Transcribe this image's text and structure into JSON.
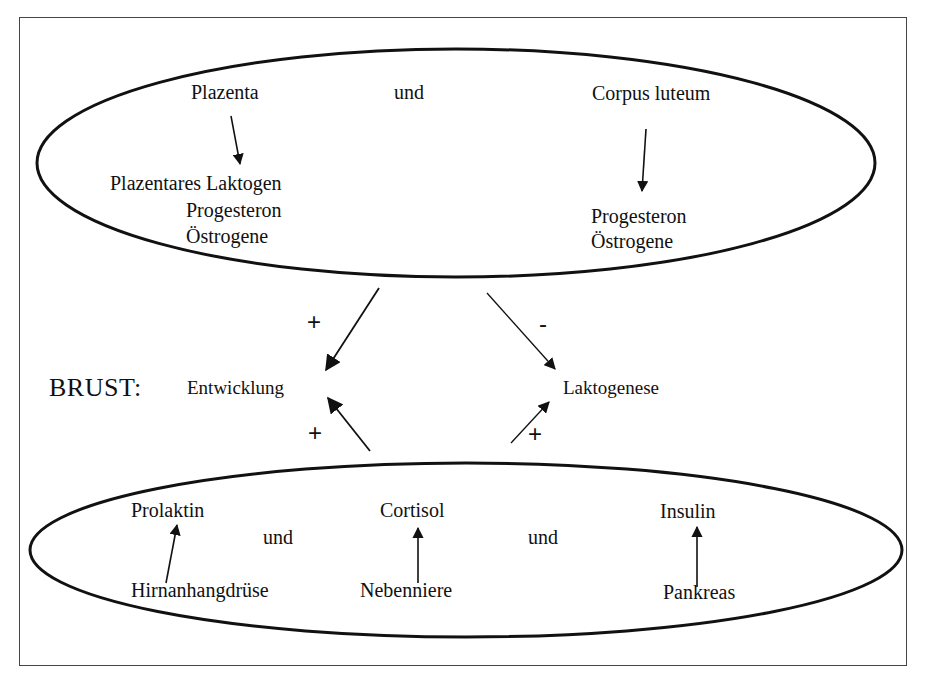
{
  "diagram": {
    "top_group": {
      "source_left": "Plazenta",
      "connector": "und",
      "source_right": "Corpus luteum",
      "products_left": [
        "Plazentares Laktogen",
        "Progesteron",
        "Östrogene"
      ],
      "products_right": [
        "Progesteron",
        "Östrogene"
      ]
    },
    "middle": {
      "organ_label": "BRUST:",
      "process_left": "Entwicklung",
      "process_right": "Laktogenese",
      "signs": {
        "top_to_entwicklung": "+",
        "top_to_laktogenese": "-",
        "bottom_to_entwicklung": "+",
        "bottom_to_laktogenese": "+"
      }
    },
    "bottom_group": {
      "hormones": [
        "Prolaktin",
        "Cortisol",
        "Insulin"
      ],
      "sources": [
        "Hirnanhangdrüse",
        "Nebenniere",
        "Pankreas"
      ],
      "connectors": [
        "und",
        "und"
      ]
    },
    "edges": [
      {
        "from": "Plazenta",
        "to": "Plazentares Laktogen / Progesteron / Östrogene"
      },
      {
        "from": "Corpus luteum",
        "to": "Progesteron / Östrogene"
      },
      {
        "from": "Top group",
        "to": "Entwicklung",
        "sign": "+"
      },
      {
        "from": "Top group",
        "to": "Laktogenese",
        "sign": "-"
      },
      {
        "from": "Bottom group",
        "to": "Entwicklung",
        "sign": "+"
      },
      {
        "from": "Bottom group",
        "to": "Laktogenese",
        "sign": "+"
      },
      {
        "from": "Hirnanhangdrüse",
        "to": "Prolaktin"
      },
      {
        "from": "Nebenniere",
        "to": "Cortisol"
      },
      {
        "from": "Pankreas",
        "to": "Insulin"
      }
    ],
    "colors": {
      "ink": "#111111",
      "frame": "#444444",
      "background": "#ffffff"
    }
  }
}
